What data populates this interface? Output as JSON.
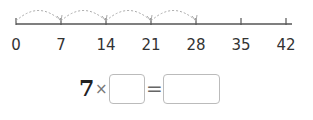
{
  "number_line": {
    "ticks": [
      0,
      7,
      14,
      21,
      28,
      35,
      42
    ],
    "tick_labels": [
      "0",
      "7",
      "14",
      "21",
      "28",
      "35",
      "42"
    ],
    "jumps": [
      [
        0,
        7
      ],
      [
        7,
        14
      ],
      [
        14,
        21
      ],
      [
        21,
        28
      ]
    ],
    "axis_color": "#555555",
    "arc_color": "#aaaaaa"
  },
  "equation": {
    "multiplicand": "7",
    "times_sign": "×",
    "equals_sign": "=",
    "blank1_value": "",
    "blank2_value": ""
  }
}
